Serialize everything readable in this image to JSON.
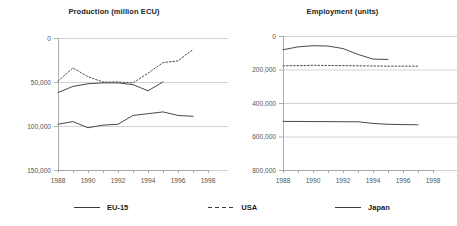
{
  "chart_data": [
    {
      "type": "line",
      "title": "Production (million ECU)",
      "xlabel": "",
      "ylabel": "",
      "xlim": [
        1988,
        1998
      ],
      "ylim": [
        0,
        150000
      ],
      "xticks": [
        "1988",
        "1990",
        "1992",
        "1994",
        "1996",
        "1998"
      ],
      "yticks": [
        "0",
        "50,000",
        "100,000",
        "150,000"
      ],
      "grid": true,
      "legend_position": "bottom",
      "x": [
        1988,
        1989,
        1990,
        1991,
        1992,
        1993,
        1994,
        1995,
        1996,
        1997
      ],
      "series": [
        {
          "name": "EU-15",
          "style": "solid",
          "color": "#4a4a4a",
          "values": [
            88000,
            95000,
            98000,
            99000,
            99000,
            97000,
            90000,
            100000,
            null,
            null
          ]
        },
        {
          "name": "USA",
          "style": "dashed",
          "color": "#4a4a4a",
          "values": [
            101000,
            116000,
            106000,
            100000,
            100000,
            99000,
            110000,
            122000,
            124000,
            137000
          ]
        },
        {
          "name": "Japan",
          "style": "solid",
          "color": "#4a4a4a",
          "values": [
            52000,
            55000,
            48000,
            51000,
            52000,
            62000,
            64000,
            66000,
            62000,
            61000
          ]
        }
      ]
    },
    {
      "type": "line",
      "title": "Employment (units)",
      "xlabel": "",
      "ylabel": "",
      "xlim": [
        1988,
        1998
      ],
      "ylim": [
        0,
        800000
      ],
      "xticks": [
        "1988",
        "1990",
        "1992",
        "1994",
        "1996",
        "1998"
      ],
      "yticks": [
        "0",
        "200,000",
        "400,000",
        "600,000",
        "800,000"
      ],
      "grid": true,
      "legend_position": "bottom",
      "x": [
        1988,
        1989,
        1990,
        1991,
        1992,
        1993,
        1994,
        1995,
        1996,
        1997
      ],
      "series": [
        {
          "name": "EU-15",
          "style": "solid",
          "color": "#4a4a4a",
          "values": [
            718000,
            735000,
            742000,
            740000,
            725000,
            690000,
            662000,
            660000,
            null,
            null
          ]
        },
        {
          "name": "USA",
          "style": "dashed",
          "color": "#4a4a4a",
          "values": [
            622000,
            623000,
            625000,
            624000,
            623000,
            622000,
            621000,
            620000,
            620000,
            620000
          ]
        },
        {
          "name": "Japan",
          "style": "solid",
          "color": "#4a4a4a",
          "values": [
            290000,
            290000,
            289000,
            289000,
            288000,
            288000,
            278000,
            273000,
            271000,
            270000
          ]
        }
      ]
    }
  ],
  "charts": {
    "production": {
      "title": "Production (million ECU)",
      "yticks": [
        "150,000",
        "100,000",
        "50,000",
        "0"
      ],
      "xticks": [
        "1988",
        "1990",
        "1992",
        "1994",
        "1996",
        "1998"
      ]
    },
    "employment": {
      "title": "Employment (units)",
      "yticks": [
        "800,000",
        "600,000",
        "400,000",
        "200,000",
        "0"
      ],
      "xticks": [
        "1988",
        "1990",
        "1992",
        "1994",
        "1996",
        "1998"
      ]
    }
  },
  "legend": {
    "items": [
      {
        "label": "EU-15",
        "style": "solid"
      },
      {
        "label": "USA",
        "style": "dashed"
      },
      {
        "label": "Japan",
        "style": "solid"
      }
    ]
  },
  "colors": {
    "line": "#4a4a4a",
    "grid": "#c8c8c8",
    "axis": "#9a9a9a",
    "text": "#555555",
    "title": "#222222"
  }
}
